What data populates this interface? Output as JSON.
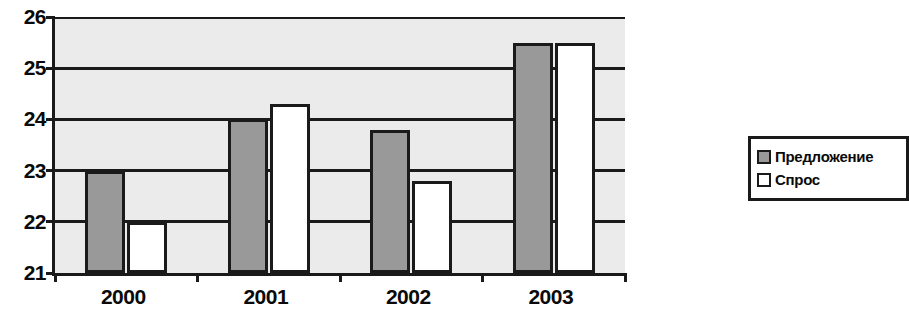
{
  "chart_data": {
    "type": "bar",
    "title": "",
    "subtitle": "",
    "xlabel": "",
    "ylabel": "",
    "categories": [
      "2000",
      "2001",
      "2002",
      "2003"
    ],
    "series": [
      {
        "name": "Предложение",
        "color": "#999999",
        "values": [
          23,
          24,
          23.8,
          25.5
        ]
      },
      {
        "name": "Спрос",
        "color": "#ffffff",
        "values": [
          22,
          24.3,
          22.8,
          25.5
        ]
      }
    ],
    "ylim": [
      21,
      26
    ],
    "yticks": [
      21,
      22,
      23,
      24,
      25,
      26
    ],
    "ytick_labels": [
      "21",
      "22",
      "23",
      "24",
      "25",
      "26"
    ],
    "grid": true,
    "grid_axis": "y",
    "legend_position": "right",
    "plot_background": "#ebebeb",
    "axis_color": "#1a1a1a"
  },
  "legend": {
    "items": [
      {
        "label": "Предложение",
        "swatch": "supply-swatch"
      },
      {
        "label": "Спрос",
        "swatch": "demand-swatch"
      }
    ]
  }
}
